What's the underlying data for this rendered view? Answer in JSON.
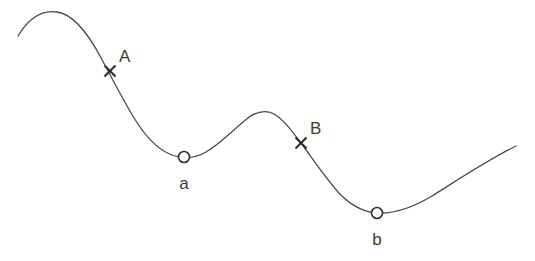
{
  "figure": {
    "type": "annotated-curve",
    "width": 535,
    "height": 261,
    "background_color": "#ffffff",
    "curve": {
      "name": "smooth-wave-curve",
      "stroke_color": "#4a4a4a",
      "stroke_width": 1.3,
      "path": "M 18,36 C 30,16 44,10 57,12 C 72,14 86,30 100,56 C 112,78 124,102 136,121 C 148,140 161,152 175,156 C 186,159 196,158 206,152 C 220,144 235,128 248,118 C 257,111 266,110 274,114 C 283,119 292,131 301,143 C 312,158 324,176 338,192 C 350,205 363,212 377,213 C 394,214 412,208 432,196 C 456,181 486,161 516,146"
    },
    "markers": [
      {
        "id": "A",
        "label": "A",
        "marker_type": "cross",
        "x": 110,
        "y": 71,
        "size": 7,
        "color": "#2e2e2e",
        "label_x": 119,
        "label_y": 62,
        "label_position": "upper-right",
        "description": "cross marker on descending slope after first peak"
      },
      {
        "id": "a",
        "label": "a",
        "marker_type": "circle",
        "x": 184,
        "y": 157,
        "radius": 5.5,
        "color": "#2e2e2e",
        "label_x": 184,
        "label_y": 189,
        "label_position": "below",
        "description": "open circle at first local minimum"
      },
      {
        "id": "B",
        "label": "B",
        "marker_type": "cross",
        "x": 301,
        "y": 143,
        "size": 7,
        "color": "#2e2e2e",
        "label_x": 310,
        "label_y": 134,
        "label_position": "upper-right",
        "description": "cross marker on descending slope after middle peak"
      },
      {
        "id": "b",
        "label": "b",
        "marker_type": "circle",
        "x": 377,
        "y": 213,
        "radius": 5.5,
        "color": "#2e2e2e",
        "label_x": 377,
        "label_y": 245,
        "label_position": "below",
        "description": "open circle at second local minimum"
      }
    ]
  }
}
